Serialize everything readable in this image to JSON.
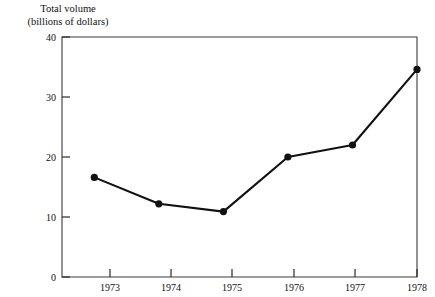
{
  "chart_data": {
    "type": "line",
    "title_line1": "Total volume",
    "title_line2": "(billions of dollars)",
    "xlabel": "",
    "ylabel": "Total volume (billions of dollars)",
    "categories": [
      "1973",
      "1974",
      "1975",
      "1976",
      "1977",
      "1978"
    ],
    "values": [
      16.6,
      12.2,
      10.9,
      20.0,
      22.0,
      34.6
    ],
    "series": [
      {
        "name": "Total volume",
        "values": [
          16.6,
          12.2,
          10.9,
          20.0,
          22.0,
          34.6
        ]
      }
    ],
    "x": [
      1973,
      1974,
      1975,
      1976,
      1977,
      1978
    ],
    "xlim": [
      1972.5,
      1978.0
    ],
    "ylim": [
      0,
      40
    ],
    "yticks": [
      0,
      10,
      20,
      30,
      40
    ],
    "ytick_labels": [
      "0",
      "10",
      "20",
      "30",
      "40"
    ],
    "xticks": [
      1973,
      1974,
      1975,
      1976,
      1977,
      1978
    ],
    "xtick_labels": [
      "1973",
      "1974",
      "1975",
      "1976",
      "1977",
      "1978"
    ],
    "grid": false,
    "legend": false,
    "legend_position": "none",
    "marker": "filled-circle",
    "line_color": "#111111",
    "marker_color": "#111111",
    "frame_color": "#3a3a3a",
    "background": "#ffffff"
  },
  "plot_geometry": {
    "left": 62,
    "right": 417,
    "top": 37,
    "bottom": 277,
    "tick_length": 8
  }
}
